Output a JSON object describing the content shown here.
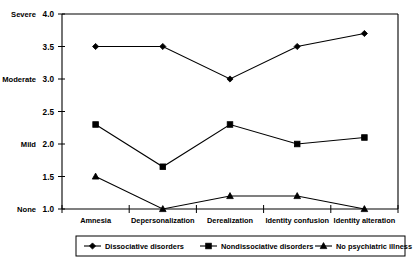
{
  "chart_data": {
    "type": "line",
    "title": "",
    "subtitle": "",
    "xlabel": "",
    "ylabel": "",
    "categories": [
      "Amnesia",
      "Depersonalization",
      "Derealization",
      "Identity confusion",
      "Identity alteration"
    ],
    "series": [
      {
        "name": "Dissociative disorders",
        "marker": "diamond",
        "values": [
          3.5,
          3.5,
          3.0,
          3.5,
          3.7
        ]
      },
      {
        "name": "Nondissociative disorders",
        "marker": "square",
        "values": [
          2.3,
          1.65,
          2.3,
          2.0,
          2.1
        ]
      },
      {
        "name": "No psychiatric illness",
        "marker": "triangle",
        "values": [
          1.5,
          1.0,
          1.2,
          1.2,
          1.0
        ]
      }
    ],
    "ylim": [
      1.0,
      4.0
    ],
    "y_ticks": [
      1.0,
      1.5,
      2.0,
      2.5,
      3.0,
      3.5,
      4.0
    ],
    "y_tick_labels": [
      "1.0",
      "1.5",
      "2.0",
      "2.5",
      "3.0",
      "3.5",
      "4.0"
    ],
    "y_anchor_labels": [
      {
        "value": 4.0,
        "text": "Severe"
      },
      {
        "value": 3.0,
        "text": "Moderate"
      },
      {
        "value": 2.0,
        "text": "Mild"
      },
      {
        "value": 1.0,
        "text": "None"
      }
    ],
    "grid": false,
    "legend_position": "bottom",
    "legend_entries": [
      "Dissociative disorders",
      "Nondissociative disorders",
      "No psychiatric illness"
    ],
    "colors": {
      "ink": "#000000",
      "background": "#ffffff"
    }
  }
}
